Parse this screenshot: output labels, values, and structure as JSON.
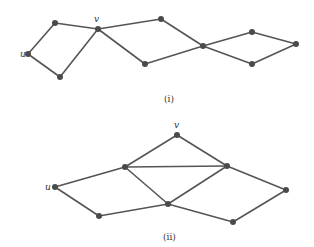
{
  "graphs": [
    {
      "caption": "(i)",
      "labels": {
        "u": "u",
        "v": "v"
      },
      "nodes": {
        "A": [
          55,
          23
        ],
        "v": [
          98,
          29
        ],
        "u": [
          28,
          54
        ],
        "B": [
          60,
          77
        ],
        "C": [
          161,
          19
        ],
        "D": [
          145,
          64
        ],
        "E": [
          203,
          46
        ],
        "F": [
          252,
          32
        ],
        "G": [
          296,
          44
        ],
        "H": [
          252,
          64
        ]
      },
      "edges": [
        [
          "u",
          "A"
        ],
        [
          "A",
          "v"
        ],
        [
          "u",
          "B"
        ],
        [
          "B",
          "v"
        ],
        [
          "v",
          "C"
        ],
        [
          "v",
          "D"
        ],
        [
          "C",
          "E"
        ],
        [
          "D",
          "E"
        ],
        [
          "E",
          "F"
        ],
        [
          "E",
          "H"
        ],
        [
          "F",
          "G"
        ],
        [
          "H",
          "G"
        ]
      ]
    },
    {
      "caption": "(ii)",
      "labels": {
        "u": "u",
        "v": "v"
      },
      "nodes": {
        "v": [
          177,
          135
        ],
        "P": [
          125,
          167
        ],
        "Q": [
          227,
          166
        ],
        "u": [
          55,
          187
        ],
        "R": [
          168,
          204
        ],
        "S": [
          99,
          216
        ],
        "T": [
          233,
          222
        ],
        "W": [
          286,
          190
        ]
      },
      "edges": [
        [
          "u",
          "P"
        ],
        [
          "u",
          "S"
        ],
        [
          "S",
          "R"
        ],
        [
          "P",
          "v"
        ],
        [
          "v",
          "Q"
        ],
        [
          "P",
          "Q"
        ],
        [
          "P",
          "R"
        ],
        [
          "R",
          "Q"
        ],
        [
          "R",
          "T"
        ],
        [
          "T",
          "W"
        ],
        [
          "Q",
          "W"
        ]
      ]
    }
  ]
}
